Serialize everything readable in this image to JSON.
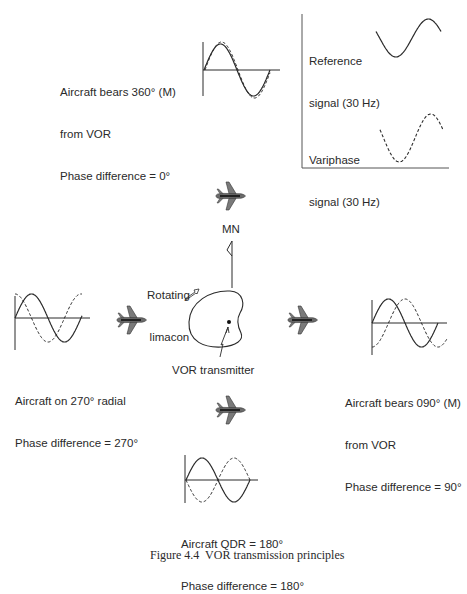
{
  "figure": {
    "caption": "Figure 4.4  VOR transmission principles",
    "inset": {
      "reference_label": [
        "Reference",
        "signal (30 Hz)"
      ],
      "variphase_label": [
        "Variphase",
        "signal (30 Hz)"
      ]
    },
    "center": {
      "north_label": "MN",
      "limacon_label": [
        "Rotating",
        "limacon"
      ],
      "transmitter_label": "VOR transmitter"
    },
    "positions": [
      {
        "id": "north",
        "lines": [
          "Aircraft bears 360° (M)",
          "from VOR",
          "Phase difference = 0°"
        ],
        "phase_deg": 0
      },
      {
        "id": "west",
        "lines": [
          "Aircraft on 270° radial",
          "Phase difference = 270°"
        ],
        "phase_deg": 270
      },
      {
        "id": "east",
        "lines": [
          "Aircraft bears 090° (M)",
          "from VOR",
          "Phase difference = 90°"
        ],
        "phase_deg": 90
      },
      {
        "id": "south",
        "lines": [
          "Aircraft QDR = 180°",
          "Phase difference = 180°"
        ],
        "phase_deg": 180
      }
    ],
    "legend": {
      "solid": "Reference signal (30 Hz)",
      "dashed": "Variphase signal (30 Hz)"
    },
    "colors": {
      "ink": "#2a2a2a",
      "aircraft_body": "#555555",
      "aircraft_stripe": "#111111"
    }
  }
}
